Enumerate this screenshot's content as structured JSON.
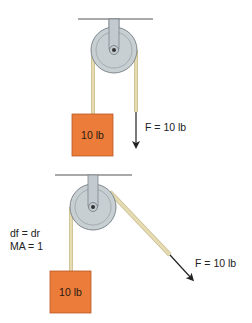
{
  "colors": {
    "background": "#ffffff",
    "ceiling": "#555555",
    "bracket": "#c3cacf",
    "bracket_stroke": "#7d868c",
    "pulley_outer": "#c8cfd3",
    "pulley_rim": "#7f888e",
    "pulley_groove": "#9aa3a9",
    "axle": "#333333",
    "rope": "#e6dcb4",
    "rope_edge": "#c9bc8c",
    "box_fill": "#ec7c3a",
    "box_stroke": "#b85a26",
    "arrow": "#222222",
    "text": "#222222"
  },
  "diagrams": [
    {
      "id": "top",
      "ceiling": {
        "x1": 78,
        "x2": 153,
        "y": 19
      },
      "pulley": {
        "cx": 114,
        "cy": 50,
        "r": 23
      },
      "load_rope": {
        "x": 93,
        "y1": 52,
        "y2": 114
      },
      "load": {
        "x": 72,
        "y": 114,
        "w": 41,
        "h": 42,
        "label": "10 lb"
      },
      "effort_rope": {
        "x1": 136,
        "y1": 52,
        "x2": 136,
        "y2": 112
      },
      "force_arrow": {
        "x1": 136,
        "y1": 112,
        "x2": 136,
        "y2": 146
      },
      "force_label": {
        "text": "F = 10 lb",
        "x": 145,
        "y": 131
      }
    },
    {
      "id": "bottom",
      "ceiling": {
        "x1": 55,
        "x2": 132,
        "y": 175
      },
      "pulley": {
        "cx": 93,
        "cy": 207,
        "r": 23
      },
      "load_rope": {
        "x": 71,
        "y1": 209,
        "y2": 271
      },
      "load": {
        "x": 50,
        "y": 271,
        "w": 41,
        "h": 42,
        "label": "10 lb"
      },
      "effort_rope": {
        "x1": 113,
        "y1": 196,
        "x2": 170,
        "y2": 255
      },
      "force_arrow": {
        "x1": 170,
        "y1": 255,
        "x2": 192,
        "y2": 279
      },
      "force_label": {
        "text": "F = 10 lb",
        "x": 195,
        "y": 267
      },
      "equations": [
        "df = dr",
        "MA = 1"
      ],
      "equations_pos": {
        "x": 10,
        "y1": 237,
        "y2": 250
      }
    }
  ]
}
